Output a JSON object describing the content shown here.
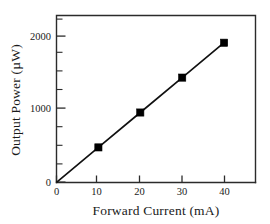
{
  "chart_data": {
    "type": "line",
    "title": "",
    "subtitle": "",
    "xlabel": "Forward Current (mA)",
    "ylabel": "Output Power (µW)",
    "xlim": [
      0,
      47.5
    ],
    "ylim": [
      0,
      2390
    ],
    "x_major_ticks": [
      0,
      10,
      20,
      30,
      40
    ],
    "x_major_tick_labels": [
      "0",
      "10",
      "20",
      "30",
      "40"
    ],
    "x_minor_ticks": [],
    "y_major_ticks": [
      0,
      1000,
      2000
    ],
    "y_major_tick_labels": [
      "0",
      "1000",
      "2000"
    ],
    "y_minor_ticks": [
      250,
      500,
      750,
      1250,
      1500,
      1750,
      2250
    ],
    "grid": false,
    "legend": null,
    "legend_position": "none",
    "marker": "filled-square",
    "marker_color": "#000000",
    "line_color": "#111111",
    "series": [
      {
        "name": "L-I characteristic",
        "x": [
          0,
          10,
          20,
          30,
          40
        ],
        "values": [
          0,
          500,
          1000,
          1500,
          2000
        ]
      }
    ],
    "annotations": []
  },
  "axis_titles": {
    "x": "Forward Current (mA)",
    "y": "Output Power (µW)"
  },
  "tick_labels": {
    "x": [
      "0",
      "10",
      "20",
      "30",
      "40"
    ],
    "y": [
      "0",
      "1000",
      "2000"
    ]
  },
  "colors": {
    "background": "#ffffff",
    "axis": "#2b2b2b",
    "data": "#000000",
    "text": "#1a1a1a"
  }
}
